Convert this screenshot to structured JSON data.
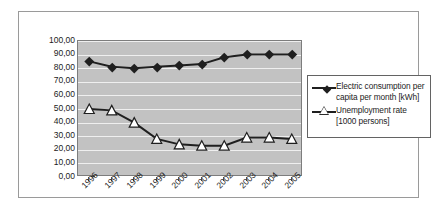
{
  "chart_data": {
    "type": "line",
    "title": "",
    "xlabel": "",
    "ylabel": "",
    "categories": [
      "1996",
      "1997",
      "1998",
      "1999",
      "2000",
      "2001",
      "2002",
      "2003",
      "2004",
      "2005"
    ],
    "ylim": [
      0,
      100
    ],
    "ytick_labels": [
      "100,00",
      "90,00",
      "80,00",
      "70,00",
      "60,00",
      "50,00",
      "40,00",
      "30,00",
      "20,00",
      "10,00",
      "0,00"
    ],
    "ytick_values": [
      100,
      90,
      80,
      70,
      60,
      50,
      40,
      30,
      20,
      10,
      0
    ],
    "grid": true,
    "legend_position": "right",
    "plot_background": "#c2c2c2",
    "gridline_color": "#efefef",
    "series": [
      {
        "name": "Electric consumption per capita per month [kWh]",
        "marker": "filled-diamond",
        "color": "#1f1f1f",
        "values": [
          85,
          81,
          80,
          81,
          82,
          83,
          88,
          90,
          90,
          90
        ]
      },
      {
        "name": "Unemployment rate [1000 persons]",
        "marker": "open-triangle",
        "color": "#1f1f1f",
        "values": [
          50,
          49,
          40,
          28,
          24,
          23,
          23,
          29,
          29,
          28
        ]
      }
    ]
  },
  "legend": {
    "entries": [
      {
        "label": "Electric consumption per capita per month [kWh]",
        "marker": "filled-diamond"
      },
      {
        "label": "Unemployment rate [1000 persons]",
        "marker": "open-triangle"
      }
    ]
  }
}
